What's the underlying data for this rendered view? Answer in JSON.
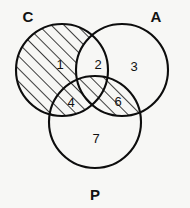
{
  "figure": {
    "type": "venn-diagram-3-set",
    "background_color": "#f7f7f5",
    "stroke_color": "#0d0d0d",
    "hatch_color": "#1a1a1a",
    "hatch_style": "diagonal-lines-45deg-up-right"
  },
  "sets": [
    {
      "id": "C",
      "label": "C",
      "label_x": 28,
      "label_y": 18,
      "cx": 62,
      "cy": 70,
      "r": 46
    },
    {
      "id": "A",
      "label": "A",
      "label_x": 156,
      "label_y": 18,
      "cx": 122,
      "cy": 70,
      "r": 46
    },
    {
      "id": "P",
      "label": "P",
      "label_x": 95,
      "label_y": 196,
      "cx": 95,
      "cy": 122,
      "r": 46
    }
  ],
  "regions": [
    {
      "id": "r1",
      "label": "1",
      "membership": "C only",
      "shaded": true,
      "label_x": 60,
      "label_y": 66
    },
    {
      "id": "r2",
      "label": "2",
      "membership": "C and A",
      "shaded": false,
      "label_x": 98,
      "label_y": 66
    },
    {
      "id": "r3",
      "label": "3",
      "membership": "A only",
      "shaded": false,
      "label_x": 134,
      "label_y": 68
    },
    {
      "id": "r4",
      "label": "4",
      "membership": "C and P",
      "shaded": true,
      "label_x": 71,
      "label_y": 104
    },
    {
      "id": "r5",
      "label": "",
      "membership": "C and A and P",
      "shaded": true,
      "label_x": 95,
      "label_y": 95
    },
    {
      "id": "r6",
      "label": "6",
      "membership": "A and P",
      "shaded": true,
      "label_x": 118,
      "label_y": 103
    },
    {
      "id": "r7",
      "label": "7",
      "membership": "P only",
      "shaded": false,
      "label_x": 96,
      "label_y": 140
    }
  ]
}
